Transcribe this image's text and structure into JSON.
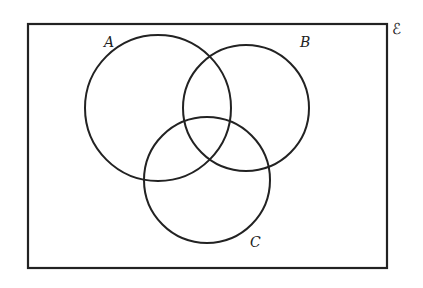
{
  "diagram": {
    "type": "venn",
    "universal_symbol": "ℰ",
    "sets": [
      {
        "label": "A",
        "cx": 158,
        "cy": 108,
        "r": 73,
        "label_x": 104,
        "label_y": 47
      },
      {
        "label": "B",
        "cx": 246,
        "cy": 108,
        "r": 63,
        "label_x": 301,
        "label_y": 47
      },
      {
        "label": "C",
        "cx": 207,
        "cy": 180,
        "r": 63,
        "label_x": 250,
        "label_y": 247
      }
    ],
    "rect": {
      "x": 28,
      "y": 24,
      "w": 359,
      "h": 244
    },
    "stroke_color": "#222222"
  }
}
